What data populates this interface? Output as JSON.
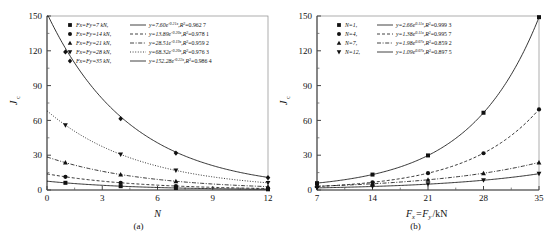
{
  "figure": {
    "panel_a_caption": "(a)",
    "panel_b_caption": "(b)",
    "y_axis_label": "J",
    "y_axis_label_sub": "c",
    "panel_a_x_label": "N",
    "panel_b_x_label": "F",
    "panel_b_x_label_sub": "x",
    "panel_b_x_label_rest": "=F",
    "panel_b_x_label_sub2": "y",
    "panel_b_x_label_unit": "/kN"
  },
  "chart_data": [
    {
      "type": "scatter",
      "panel": "a",
      "title": "(a)",
      "xlabel": "N",
      "ylabel": "Jc",
      "xlim": [
        0,
        12
      ],
      "ylim": [
        0,
        150
      ],
      "xticks": [
        0,
        3,
        6,
        9,
        12
      ],
      "yticks": [
        0,
        30,
        60,
        90,
        120,
        150
      ],
      "grid": false,
      "legend_position": "top-left",
      "series": [
        {
          "name": "Fx=Fy=7 kN",
          "marker": "square",
          "line": "solid",
          "equation": "y=7.60e",
          "exponent": "-0.21x",
          "r2_label": "R",
          "r2_value": "=0.962 7",
          "amplitude": 7.6,
          "rate": -0.21,
          "x": [
            1,
            4,
            7,
            12
          ],
          "y": [
            6.2,
            3.3,
            1.7,
            0.6
          ]
        },
        {
          "name": "Fx=Fy=14 kN",
          "marker": "circle",
          "line": "dashed",
          "equation": "y=13.89e",
          "exponent": "-0.20x",
          "r2_label": "R",
          "r2_value": "=0.978 1",
          "amplitude": 13.89,
          "rate": -0.2,
          "x": [
            1,
            4,
            7,
            12
          ],
          "y": [
            11.4,
            6.2,
            3.4,
            1.3
          ]
        },
        {
          "name": "Fx=Fy=21 kN",
          "marker": "triangle-up",
          "line": "dashdot",
          "equation": "y=28.51e",
          "exponent": "-0.19x",
          "r2_label": "R",
          "r2_value": "=0.959 2",
          "amplitude": 28.51,
          "rate": -0.19,
          "x": [
            1,
            4,
            7,
            12
          ],
          "y": [
            23.6,
            13.3,
            7.5,
            2.9
          ]
        },
        {
          "name": "Fx=Fy=28 kN",
          "marker": "triangle-down",
          "line": "dotted",
          "equation": "y=68.32e",
          "exponent": "-0.20x",
          "r2_label": "R",
          "r2_value": "=0.976 3",
          "amplitude": 68.32,
          "rate": -0.2,
          "x": [
            1,
            4,
            7,
            12
          ],
          "y": [
            55.9,
            30.7,
            16.9,
            6.2
          ]
        },
        {
          "name": "Fx=Fy=35 kN",
          "marker": "diamond",
          "line": "solid",
          "equation": "y=152.28e",
          "exponent": "-0.22x",
          "r2_label": "R",
          "r2_value": "=0.986 4",
          "amplitude": 152.28,
          "rate": -0.22,
          "x": [
            1,
            4,
            7,
            12
          ],
          "y": [
            119.0,
            61.5,
            31.8,
            10.6
          ]
        }
      ]
    },
    {
      "type": "scatter",
      "panel": "b",
      "title": "(b)",
      "xlabel": "Fx=Fy/kN",
      "ylabel": "Jc",
      "xlim": [
        7,
        35
      ],
      "ylim": [
        0,
        150
      ],
      "xticks": [
        7,
        14,
        21,
        28,
        35
      ],
      "yticks": [
        0,
        30,
        60,
        90,
        120,
        150
      ],
      "grid": false,
      "legend_position": "top-left",
      "series": [
        {
          "name": "N=1",
          "marker": "square",
          "line": "solid",
          "equation": "y=2.66e",
          "exponent": "0.11x",
          "r2_label": "R",
          "r2_value": "=0.999 3",
          "amplitude": 2.66,
          "rate": 0.115,
          "x": [
            7,
            14,
            21,
            28,
            35
          ],
          "y": [
            5.9,
            13.3,
            29.8,
            66.6,
            149.0
          ]
        },
        {
          "name": "N=4",
          "marker": "circle",
          "line": "dashed",
          "equation": "y=1.38e",
          "exponent": "0.11x",
          "r2_label": "R",
          "r2_value": "=0.995 7",
          "amplitude": 1.38,
          "rate": 0.112,
          "x": [
            7,
            14,
            21,
            28,
            35
          ],
          "y": [
            3.0,
            6.6,
            14.5,
            31.7,
            69.5
          ]
        },
        {
          "name": "N=7",
          "marker": "triangle-up",
          "line": "dashdot",
          "equation": "y=1.98e",
          "exponent": "0.07x",
          "r2_label": "R",
          "r2_value": "=0.859 2",
          "amplitude": 1.98,
          "rate": 0.071,
          "x": [
            7,
            14,
            21,
            28,
            35
          ],
          "y": [
            3.3,
            5.4,
            8.8,
            14.4,
            23.7
          ]
        },
        {
          "name": "N=12",
          "marker": "triangle-down",
          "line": "solid",
          "equation": "y=1.09e",
          "exponent": "0.07x",
          "r2_label": "R",
          "r2_value": "=0.897 5",
          "amplitude": 1.09,
          "rate": 0.073,
          "x": [
            7,
            14,
            21,
            28,
            35
          ],
          "y": [
            1.8,
            3.0,
            5.0,
            8.4,
            14.0
          ]
        }
      ]
    }
  ]
}
